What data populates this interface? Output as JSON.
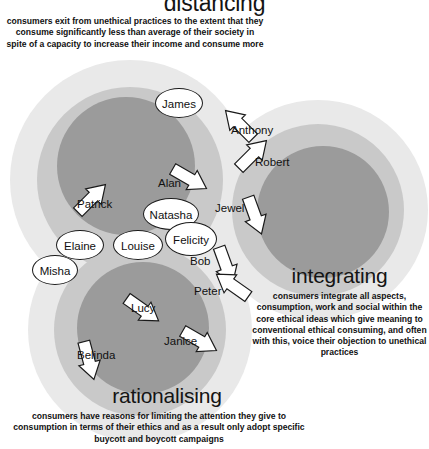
{
  "figure": {
    "type": "venn-cluster-diagram",
    "background": "#ffffff",
    "palette": {
      "core": "#9b9b9b",
      "ring": "#c9c9c9",
      "halo": "#e9e9e9",
      "text": "#111111",
      "outline": "#1a1a1a",
      "arrow_fill": "#ffffff"
    }
  },
  "sections": {
    "distancing": {
      "title": "distancing",
      "body": "consumers exit from unethical practices to the extent that they consume significantly less than average of their society in spite of a capacity to increase their income and consume more"
    },
    "integrating": {
      "title": "integrating",
      "body": "consumers integrate all aspects, consumption, work and social within the core ethical ideas which give meaning to conventional ethical consuming, and often with this, voice their objection to unethical practices"
    },
    "rationalising": {
      "title": "rationalising",
      "body": "consumers have reasons for limiting the attention they give to consumption in terms of their ethics and as a result only adopt specific buycott and boycott campaigns"
    }
  },
  "people": [
    {
      "name": "James",
      "marker": "circle",
      "x": 155,
      "y": 88,
      "w": 48,
      "h": 30
    },
    {
      "name": "Anthony",
      "marker": "arrow",
      "x": 231,
      "y": 125,
      "w": 56,
      "h": 14,
      "direction": "up-left",
      "ax": -12,
      "ay": -12,
      "arot": 225
    },
    {
      "name": "Robert",
      "marker": "arrow",
      "x": 255,
      "y": 157,
      "w": 48,
      "h": 14,
      "direction": "down-right",
      "ax": -22,
      "ay": -14,
      "arot": 315
    },
    {
      "name": "Alan",
      "marker": "arrow",
      "x": 158,
      "y": 178,
      "w": 32,
      "h": 14,
      "direction": "up-right",
      "ax": 12,
      "ay": -10,
      "arot": 30
    },
    {
      "name": "Patrick",
      "marker": "arrow",
      "x": 77,
      "y": 199,
      "w": 48,
      "h": 14,
      "direction": "down-right",
      "ax": -5,
      "ay": -12,
      "arot": 315
    },
    {
      "name": "Natasha",
      "marker": "circle",
      "x": 143,
      "y": 198,
      "w": 56,
      "h": 32
    },
    {
      "name": "Jewel",
      "marker": "arrow",
      "x": 215,
      "y": 203,
      "w": 36,
      "h": 14,
      "direction": "right",
      "ax": 20,
      "ay": 2,
      "arot": 70
    },
    {
      "name": "Elaine",
      "marker": "circle",
      "x": 56,
      "y": 230,
      "w": 48,
      "h": 30
    },
    {
      "name": "Louise",
      "marker": "circle",
      "x": 113,
      "y": 230,
      "w": 50,
      "h": 30
    },
    {
      "name": "Felicity",
      "marker": "circle",
      "x": 165,
      "y": 222,
      "w": 52,
      "h": 34
    },
    {
      "name": "Misha",
      "marker": "circle",
      "x": 32,
      "y": 255,
      "w": 46,
      "h": 30
    },
    {
      "name": "Bob",
      "marker": "arrow",
      "x": 190,
      "y": 256,
      "w": 28,
      "h": 14,
      "direction": "right",
      "ax": 16,
      "ay": -1,
      "arot": 70
    },
    {
      "name": "Peter",
      "marker": "arrow",
      "x": 194,
      "y": 286,
      "w": 36,
      "h": 14,
      "direction": "up-left",
      "ax": 18,
      "ay": -12,
      "arot": 215
    },
    {
      "name": "Lucy",
      "marker": "arrow",
      "x": 131,
      "y": 303,
      "w": 32,
      "h": 14,
      "direction": "up-right",
      "ax": -8,
      "ay": -4,
      "arot": 35
    },
    {
      "name": "Janice",
      "marker": "arrow",
      "x": 164,
      "y": 336,
      "w": 40,
      "h": 14,
      "direction": "up-right",
      "ax": 16,
      "ay": -6,
      "arot": 30
    },
    {
      "name": "Belinda",
      "marker": "arrow",
      "x": 77,
      "y": 350,
      "w": 48,
      "h": 14,
      "direction": "right",
      "ax": -8,
      "ay": 0,
      "arot": 75
    }
  ]
}
